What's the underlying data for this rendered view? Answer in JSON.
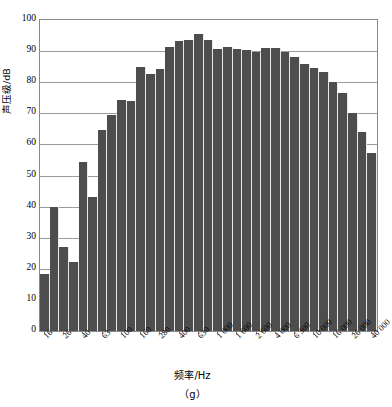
{
  "chart_data": {
    "type": "bar",
    "title": "",
    "subtitle": "",
    "caption": "（g）",
    "xlabel": "频率/Hz",
    "ylabel": "声压级/dB",
    "ylim": [
      0,
      100
    ],
    "ytick_step": 10,
    "yticks": [
      "0",
      "10",
      "20",
      "30",
      "40",
      "50",
      "60",
      "70",
      "80",
      "90",
      "100"
    ],
    "grid": true,
    "grid_axis": "y",
    "legend": null,
    "legend_position": "none",
    "bar_color": "#4d4d4d",
    "bar_count": 35,
    "categories": [
      "16",
      "20",
      "26",
      "32",
      "40",
      "50",
      "63",
      "80",
      "100",
      "125",
      "160",
      "200",
      "280",
      "320",
      "400",
      "500",
      "630",
      "800",
      "1 000",
      "1 250",
      "1 600",
      "2 000",
      "2 600",
      "3 200",
      "4 000",
      "5 000",
      "6 300",
      "8 000",
      "10 000",
      "12 500",
      "16 000",
      "20 000",
      "26 000",
      "32 000",
      "40 000"
    ],
    "tick_labels": [
      "16",
      "26",
      "40",
      "63",
      "100",
      "160",
      "280",
      "400",
      "630",
      "1 000",
      "1 600",
      "2 600",
      "4 000",
      "6 300",
      "10 000",
      "16 000",
      "26 000",
      "40 000"
    ],
    "tick_label_indices": [
      0,
      2,
      4,
      6,
      8,
      10,
      12,
      14,
      16,
      18,
      20,
      22,
      24,
      26,
      28,
      30,
      32,
      34
    ],
    "values": [
      18.3,
      40.0,
      27.0,
      22.2,
      54.5,
      43.2,
      64.5,
      69.6,
      74.4,
      74.0,
      85.0,
      82.5,
      84.2,
      91.4,
      93.2,
      93.5,
      95.5,
      93.6,
      90.8,
      91.2,
      90.7,
      90.5,
      89.8,
      91.0,
      91.0,
      89.6,
      88.0,
      86.0,
      84.5,
      83.2,
      80.0,
      76.5,
      70.0,
      63.9,
      57.2
    ],
    "series_name": "声压级"
  }
}
